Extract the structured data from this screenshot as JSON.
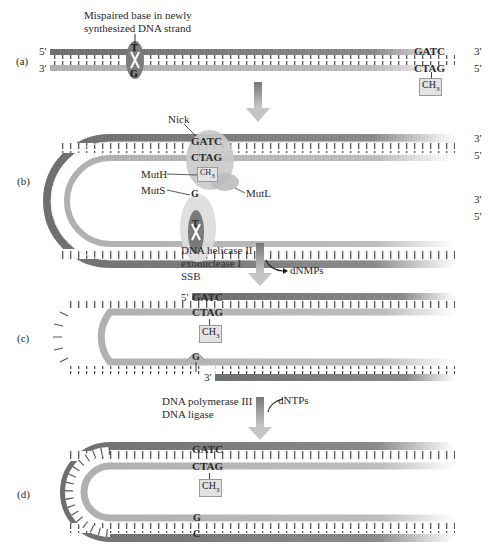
{
  "colors": {
    "dark_strand": "#6f6f6f",
    "light_strand": "#b5b5b5",
    "enzyme_fill": "#d6d6d6",
    "arrow": "#9a9a9a",
    "background": "#ffffff"
  },
  "title": {
    "line1": "Mispaired base in newly",
    "line2": "synthesized DNA strand"
  },
  "panels": {
    "a": {
      "label": "(a)",
      "top_left_end": "5'",
      "bottom_left_end": "3'",
      "top_right_end": "3'",
      "bottom_right_end": "5'",
      "mismatch_top": "T",
      "mismatch_bottom": "G",
      "site_top": "GATC",
      "site_bottom": "CTAG",
      "methyl": "CH",
      "methyl_sub": "3"
    },
    "b": {
      "label": "(b)",
      "nick": "Nick",
      "site_top": "GATC",
      "site_bottom": "CTAG",
      "methyl": "CH",
      "methyl_sub": "3",
      "muth": "MutH",
      "muts": "MutS",
      "mutl": "MutL",
      "mismatch_top": "G",
      "mismatch_bottom": "T",
      "ends": [
        "3'",
        "5'",
        "3'",
        "5'"
      ]
    },
    "c": {
      "label": "(c)",
      "five_prime": "5'",
      "three_prime": "3'",
      "site_top": "GATC",
      "site_bottom": "CTAG",
      "methyl": "CH",
      "methyl_sub": "3",
      "base": "G"
    },
    "d": {
      "label": "(d)",
      "site_top": "GATC",
      "site_bottom": "CTAG",
      "methyl": "CH",
      "methyl_sub": "3",
      "base_top": "G",
      "base_bottom": "C"
    }
  },
  "steps": {
    "step1": {
      "enzymes": [
        "DNA helicase II",
        "exonuclease I",
        "SSB"
      ],
      "product": "dNMPs"
    },
    "step2": {
      "enzymes": [
        "DNA polymerase III",
        "DNA ligase"
      ],
      "substrate": "dNTPs"
    }
  }
}
